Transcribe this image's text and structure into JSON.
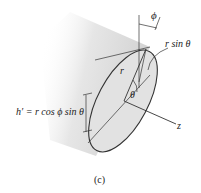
{
  "figure": {
    "caption": "(c)",
    "labels": {
      "phi": "ϕ",
      "r_sin_theta": "r sin θ",
      "r": "r",
      "theta": "θ",
      "h_prime": "h′ = r cos ϕ sin θ",
      "z": "z"
    },
    "colors": {
      "cylinder_fill": "#d6d6d6",
      "face_fill": "#e4e4e4",
      "line": "#333333"
    }
  }
}
